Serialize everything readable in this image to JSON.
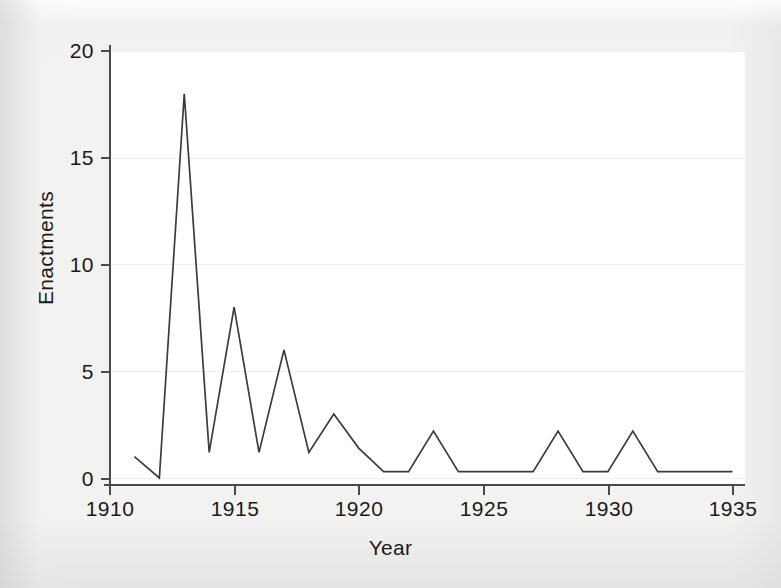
{
  "figure": {
    "background_color": "#f2f2f0",
    "panel_color": "#ffffff",
    "line_color": "#3c3c3c",
    "axis_color": "#4a4a4a",
    "grid_color": "#efefef"
  },
  "chart_data": {
    "type": "line",
    "title": "",
    "xlabel": "Year",
    "ylabel": "Enactments",
    "xlim": [
      1910,
      1935
    ],
    "ylim": [
      0,
      20
    ],
    "xticks": [
      1910,
      1915,
      1920,
      1925,
      1930,
      1935
    ],
    "xticklabels": [
      "1910",
      "1915",
      "1920",
      "1925",
      "1930",
      "1935"
    ],
    "yticks": [
      0,
      5,
      10,
      15,
      20
    ],
    "yticklabels": [
      "0",
      "5",
      "10",
      "15",
      "20"
    ],
    "grid": "horizontal",
    "legend": "none",
    "x": [
      1911,
      1912,
      1913,
      1914,
      1915,
      1916,
      1917,
      1918,
      1919,
      1920,
      1921,
      1922,
      1923,
      1924,
      1925,
      1926,
      1927,
      1928,
      1929,
      1930,
      1931,
      1932,
      1933,
      1934,
      1935
    ],
    "values": [
      1,
      0,
      18,
      1.2,
      8,
      1.2,
      6,
      1.2,
      3,
      1.4,
      0.3,
      0.3,
      2.2,
      0.3,
      0.3,
      0.3,
      0.3,
      2.2,
      0.3,
      0.3,
      2.2,
      0.3,
      0.3,
      0.3,
      0.3
    ],
    "series": [
      {
        "name": "Enactments",
        "values": [
          1,
          0,
          18,
          1.2,
          8,
          1.2,
          6,
          1.2,
          3,
          1.4,
          0.3,
          0.3,
          2.2,
          0.3,
          0.3,
          0.3,
          0.3,
          2.2,
          0.3,
          0.3,
          2.2,
          0.3,
          0.3,
          0.3,
          0.3
        ]
      }
    ],
    "annotations": []
  }
}
